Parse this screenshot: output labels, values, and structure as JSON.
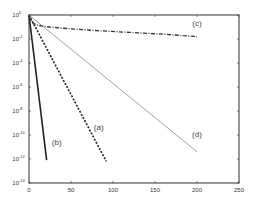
{
  "chart_data": {
    "type": "line",
    "title": "",
    "xlabel": "",
    "ylabel": "",
    "xscale": "linear",
    "yscale": "log",
    "xlim": [
      0,
      250
    ],
    "ylim": [
      1e-14,
      1
    ],
    "grid": false,
    "x_ticks": [
      0,
      50,
      100,
      150,
      200,
      250
    ],
    "x_tick_labels": [
      "0",
      "50",
      "100",
      "150",
      "200",
      "250"
    ],
    "y_ticks": [
      0,
      -2,
      -4,
      -6,
      -8,
      -10,
      -12,
      -14
    ],
    "y_tick_labels": [
      {
        "base": "10",
        "exp": "0"
      },
      {
        "base": "10",
        "exp": "-2"
      },
      {
        "base": "10",
        "exp": "-4"
      },
      {
        "base": "10",
        "exp": "-6"
      },
      {
        "base": "10",
        "exp": "-8"
      },
      {
        "base": "10",
        "exp": "-10"
      },
      {
        "base": "10",
        "exp": "-12"
      },
      {
        "base": "10",
        "exp": "-14"
      }
    ],
    "series": [
      {
        "name": "(a)",
        "style": "dotted-dashed-thick",
        "x": [
          0,
          92
        ],
        "log10_y": [
          0,
          -12.2
        ],
        "label_at": {
          "x": 83,
          "log10_y": -9.6
        }
      },
      {
        "name": "(b)",
        "style": "solid-thick",
        "x": [
          0,
          21
        ],
        "log10_y": [
          0,
          -12.1
        ],
        "label_at": {
          "x": 33,
          "log10_y": -10.8
        }
      },
      {
        "name": "(c)",
        "style": "dash-dot",
        "x": [
          0,
          2,
          5,
          10,
          20,
          40,
          80,
          120,
          160,
          200
        ],
        "log10_y": [
          0,
          -0.45,
          -0.7,
          -0.85,
          -0.97,
          -1.1,
          -1.3,
          -1.45,
          -1.6,
          -1.8
        ],
        "label_at": {
          "x": 200,
          "log10_y": -0.9
        }
      },
      {
        "name": "(d)",
        "style": "solid-thin",
        "x": [
          0,
          200
        ],
        "log10_y": [
          0,
          -11.4
        ],
        "label_at": {
          "x": 200,
          "log10_y": -10.2
        }
      }
    ]
  }
}
